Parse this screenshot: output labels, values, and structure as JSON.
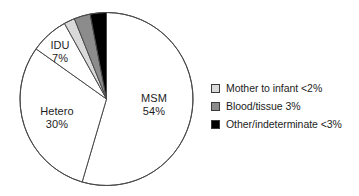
{
  "chart_data": {
    "type": "pie",
    "title": "",
    "subtitle": "",
    "xlabel": "",
    "ylabel": "",
    "grid": false,
    "legend_position": "right",
    "start_angle_deg": 0,
    "direction": "clockwise",
    "categories": [
      "MSM",
      "Hetero",
      "IDU",
      "Mother to infant",
      "Blood/tissue",
      "Other/indeterminate"
    ],
    "values": [
      54,
      30,
      7,
      2,
      3,
      3
    ],
    "value_labels": [
      "54%",
      "30%",
      "7%",
      "<2%",
      "3%",
      "<3%"
    ],
    "colors": [
      "#ffffff",
      "#ffffff",
      "#ffffff",
      "#d9d9d9",
      "#8c8c8c",
      "#000000"
    ],
    "slices": [
      {
        "name": "MSM",
        "value": 54,
        "label": "MSM",
        "percent_label": "54%",
        "color": "#ffffff",
        "labeled_on_chart": true
      },
      {
        "name": "Hetero",
        "value": 30,
        "label": "Hetero",
        "percent_label": "30%",
        "color": "#ffffff",
        "labeled_on_chart": true
      },
      {
        "name": "IDU",
        "value": 7,
        "label": "IDU",
        "percent_label": "7%",
        "color": "#ffffff",
        "labeled_on_chart": true
      },
      {
        "name": "Mother to infant",
        "value": 2,
        "label": "Mother to infant",
        "percent_label": "<2%",
        "color": "#d9d9d9",
        "labeled_on_chart": false
      },
      {
        "name": "Blood/tissue",
        "value": 3,
        "label": "Blood/tissue",
        "percent_label": "3%",
        "color": "#8c8c8c",
        "labeled_on_chart": false
      },
      {
        "name": "Other/indeterminate",
        "value": 3,
        "label": "Other/indeterminate",
        "percent_label": "<3%",
        "color": "#000000",
        "labeled_on_chart": false
      }
    ],
    "legend": [
      {
        "label": "Mother to infant <2%",
        "color": "#d9d9d9"
      },
      {
        "label": "Blood/tissue 3%",
        "color": "#8c8c8c"
      },
      {
        "label": "Other/indeterminate <3%",
        "color": "#000000"
      }
    ]
  },
  "pie_labels": {
    "msm": {
      "name": "MSM",
      "percent": "54%"
    },
    "hetero": {
      "name": "Hetero",
      "percent": "30%"
    },
    "idu": {
      "name": "IDU",
      "percent": "7%"
    }
  },
  "legend": {
    "entries": [
      {
        "label": "Mother to infant <2%",
        "color": "#d9d9d9"
      },
      {
        "label": "Blood/tissue 3%",
        "color": "#8c8c8c"
      },
      {
        "label": "Other/indeterminate <3%",
        "color": "#000000"
      }
    ]
  },
  "style": {
    "outline": "#4a4a4a",
    "background": "#ffffff"
  }
}
